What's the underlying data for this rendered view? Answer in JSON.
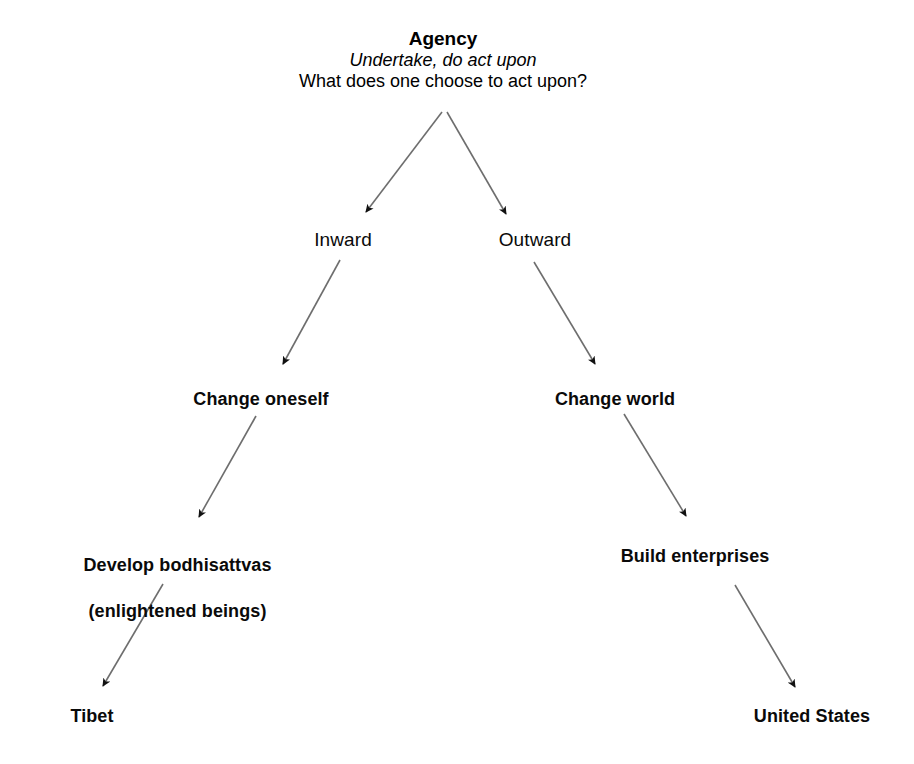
{
  "diagram": {
    "title": "Agency",
    "subtitle_italic": "Undertake, do act upon",
    "question": "What does one choose to act upon?",
    "nodes": {
      "root_title": "Agency",
      "root_italic": "Undertake, do act upon",
      "root_question": "What does one choose to act upon?",
      "inward": "Inward",
      "outward": "Outward",
      "change_oneself": "Change oneself",
      "change_world": "Change world",
      "develop_bodhisattvas_line1": "Develop bodhisattvas",
      "develop_bodhisattvas_line2": "(enlightened beings)",
      "build_enterprises": "Build enterprises",
      "tibet": "Tibet",
      "united_states": "United States"
    },
    "colors": {
      "text": "#0a0a0a",
      "line": "#6e6e6e",
      "arrowhead": "#111111",
      "background": "#ffffff"
    },
    "edges": [
      {
        "from": "Agency",
        "to": "Inward"
      },
      {
        "from": "Agency",
        "to": "Outward"
      },
      {
        "from": "Inward",
        "to": "Change oneself"
      },
      {
        "from": "Outward",
        "to": "Change world"
      },
      {
        "from": "Change oneself",
        "to": "Develop bodhisattvas (enlightened beings)"
      },
      {
        "from": "Change world",
        "to": "Build enterprises"
      },
      {
        "from": "Develop bodhisattvas (enlightened beings)",
        "to": "Tibet"
      },
      {
        "from": "Build enterprises",
        "to": "United States"
      }
    ]
  }
}
